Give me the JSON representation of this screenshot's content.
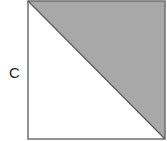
{
  "diagram": {
    "type": "geometry",
    "labels": {
      "side_left": "C"
    },
    "colors": {
      "shade": "#a9a9a9",
      "stroke": "#6f6f6f",
      "background": "#ffffff"
    }
  }
}
